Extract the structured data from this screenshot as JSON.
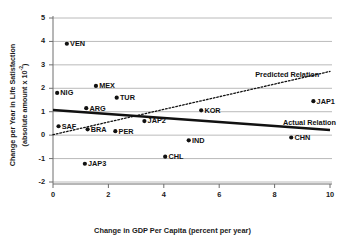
{
  "chart_data": {
    "type": "scatter",
    "title": "",
    "xlabel": "Change in GDP Per Capita (percent per year)",
    "ylabel_line1": "Change per Year in Life Satisfaction",
    "ylabel_line2": "(absolute amount x 10",
    "ylabel_exponent": "-2",
    "ylabel_line2_close": ")",
    "xlim": [
      0,
      10
    ],
    "ylim": [
      -2,
      5
    ],
    "xticks": [
      "0",
      "2",
      "4",
      "6",
      "8",
      "10"
    ],
    "xtick_values": [
      0,
      2,
      4,
      6,
      8,
      10
    ],
    "yticks": [
      "5",
      "4",
      "3",
      "2",
      "1",
      "0",
      "-1",
      "-2"
    ],
    "ytick_values": [
      5,
      4,
      3,
      2,
      1,
      0,
      -1,
      -2
    ],
    "grid": "horizontal",
    "legend_position": "inline-annotations",
    "marker_color": "#111111",
    "points": [
      {
        "label": "VEN",
        "x": 0.5,
        "y": 3.9,
        "label_side": "right"
      },
      {
        "label": "NIG",
        "x": 0.15,
        "y": 1.8,
        "label_side": "right"
      },
      {
        "label": "MEX",
        "x": 1.55,
        "y": 2.1,
        "label_side": "right"
      },
      {
        "label": "TUR",
        "x": 2.3,
        "y": 1.6,
        "label_side": "right"
      },
      {
        "label": "ARG",
        "x": 1.2,
        "y": 1.15,
        "label_side": "right"
      },
      {
        "label": "SAF",
        "x": 0.2,
        "y": 0.38,
        "label_side": "right"
      },
      {
        "label": "BRA",
        "x": 1.25,
        "y": 0.25,
        "label_side": "right"
      },
      {
        "label": "PER",
        "x": 2.25,
        "y": 0.17,
        "label_side": "right"
      },
      {
        "label": "JAP2",
        "x": 3.3,
        "y": 0.6,
        "label_side": "right"
      },
      {
        "label": "KOR",
        "x": 5.35,
        "y": 1.06,
        "label_side": "right"
      },
      {
        "label": "JAP1",
        "x": 9.4,
        "y": 1.45,
        "label_side": "right"
      },
      {
        "label": "IND",
        "x": 4.9,
        "y": -0.22,
        "label_side": "right"
      },
      {
        "label": "CHN",
        "x": 8.6,
        "y": -0.1,
        "label_side": "right"
      },
      {
        "label": "CHL",
        "x": 4.05,
        "y": -0.92,
        "label_side": "right"
      },
      {
        "label": "JAP3",
        "x": 1.15,
        "y": -1.22,
        "label_side": "right"
      }
    ],
    "lines": [
      {
        "name": "Actual Relation",
        "style": "solid",
        "color": "#111111",
        "width": 2.6,
        "x_start": 0.0,
        "y_start": 1.07,
        "x_end": 10.0,
        "y_end": 0.22,
        "annotation": "Actual Relation"
      },
      {
        "name": "Predicted Relation",
        "style": "dotted",
        "color": "#111111",
        "width": 1.3,
        "x_start": 0.0,
        "y_start": 0.02,
        "x_end": 10.0,
        "y_end": 2.72,
        "annotation": "Predicted Relation"
      }
    ],
    "annotations": [
      {
        "text": "Predicted Relation",
        "x": 7.3,
        "y": 2.55
      },
      {
        "text": "Actual Relation",
        "x": 8.3,
        "y": 0.52
      }
    ]
  }
}
